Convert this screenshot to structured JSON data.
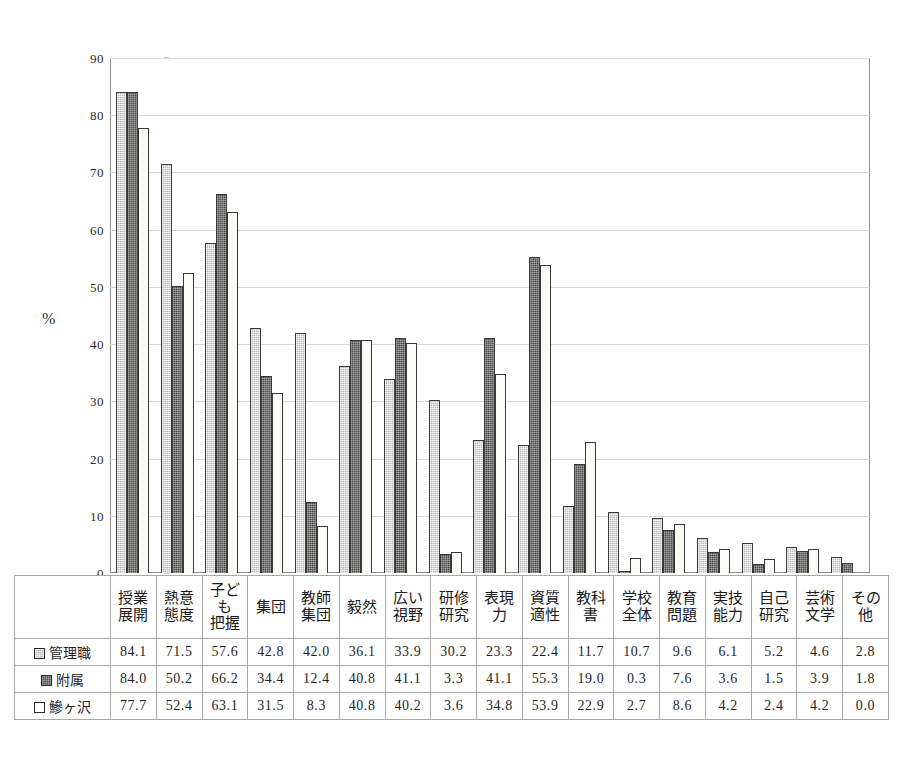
{
  "chart_data": {
    "type": "bar",
    "title": "",
    "subtitle": "",
    "xlabel": "",
    "ylabel": "%",
    "ylim": [
      0,
      90
    ],
    "ytick_step": 10,
    "yticks": [
      "90",
      "80",
      "70",
      "60",
      "50",
      "40",
      "30",
      "20",
      "10",
      "0"
    ],
    "grid": true,
    "legend_position": "table-row-labels",
    "categories": [
      "授業\n展開",
      "熱意\n態度",
      "子ども\n把握",
      "集団",
      "教師\n集団",
      "毅然",
      "広い\n視野",
      "研修\n研究",
      "表現\n力",
      "資質\n適性",
      "教科\n書",
      "学校\n全体",
      "教育\n問題",
      "実技\n能力",
      "自己\n研究",
      "芸術\n文学",
      "その\n他"
    ],
    "series": [
      {
        "name": "管理職",
        "marker": "light-gray-speckle",
        "color": "#b9b9b9",
        "values": [
          84.1,
          71.5,
          57.6,
          42.8,
          42.0,
          36.1,
          33.9,
          30.2,
          23.3,
          22.4,
          11.7,
          10.7,
          9.6,
          6.1,
          5.2,
          4.6,
          2.8
        ]
      },
      {
        "name": "附属",
        "marker": "dark-gray-speckle",
        "color": "#4a4a48",
        "values": [
          84.0,
          50.2,
          66.2,
          34.4,
          12.4,
          40.8,
          41.1,
          3.3,
          41.1,
          55.3,
          19.0,
          0.3,
          7.6,
          3.6,
          1.5,
          3.9,
          1.8
        ]
      },
      {
        "name": "鰺ヶ沢",
        "marker": "white-outline",
        "color": "#ffffff",
        "values": [
          77.7,
          52.4,
          63.1,
          31.5,
          8.3,
          40.8,
          40.2,
          3.6,
          34.8,
          53.9,
          22.9,
          2.7,
          8.6,
          4.2,
          2.4,
          4.2,
          0.0
        ]
      }
    ]
  },
  "table": {
    "row_labels": [
      "管理職",
      "附属",
      "鰺ヶ沢"
    ],
    "column_headers": [
      [
        "授業",
        "展開"
      ],
      [
        "熱意",
        "態度"
      ],
      [
        "子ども",
        "把握"
      ],
      [
        "集団",
        ""
      ],
      [
        "教師",
        "集団"
      ],
      [
        "毅然",
        ""
      ],
      [
        "広い",
        "視野"
      ],
      [
        "研修",
        "研究"
      ],
      [
        "表現",
        "力"
      ],
      [
        "資質",
        "適性"
      ],
      [
        "教科",
        "書"
      ],
      [
        "学校",
        "全体"
      ],
      [
        "教育",
        "問題"
      ],
      [
        "実技",
        "能力"
      ],
      [
        "自己",
        "研究"
      ],
      [
        "芸術",
        "文学"
      ],
      [
        "その",
        "他"
      ]
    ],
    "rows": [
      [
        "84.1",
        "71.5",
        "57.6",
        "42.8",
        "42.0",
        "36.1",
        "33.9",
        "30.2",
        "23.3",
        "22.4",
        "11.7",
        "10.7",
        "9.6",
        "6.1",
        "5.2",
        "4.6",
        "2.8"
      ],
      [
        "84.0",
        "50.2",
        "66.2",
        "34.4",
        "12.4",
        "40.8",
        "41.1",
        "3.3",
        "41.1",
        "55.3",
        "19.0",
        "0.3",
        "7.6",
        "3.6",
        "1.5",
        "3.9",
        "1.8"
      ],
      [
        "77.7",
        "52.4",
        "63.1",
        "31.5",
        "8.3",
        "40.8",
        "40.2",
        "3.6",
        "34.8",
        "53.9",
        "22.9",
        "2.7",
        "8.6",
        "4.2",
        "2.4",
        "4.2",
        "0.0"
      ]
    ]
  },
  "axis": {
    "y_unit_label": "%"
  }
}
